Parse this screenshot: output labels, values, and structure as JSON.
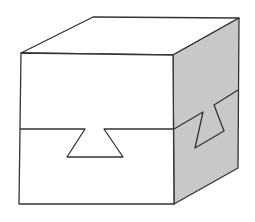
{
  "figure": {
    "colors": {
      "stroke": "#333333",
      "front_face": "#ffffff",
      "top_face": "#ffffff",
      "right_face": "#c8c8c8",
      "background": "#ffffff"
    }
  }
}
